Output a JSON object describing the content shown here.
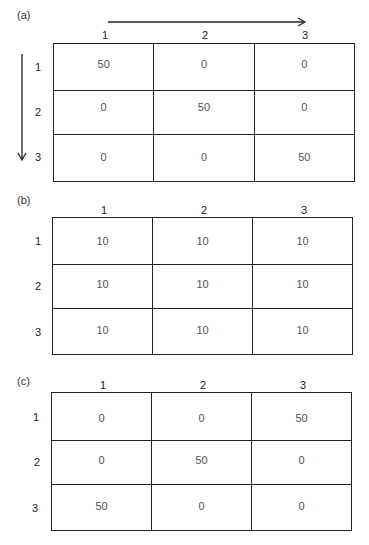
{
  "panels": [
    {
      "label": "(a)",
      "col_headers": [
        "1",
        "2",
        "3"
      ],
      "row_headers": [
        "1",
        "2",
        "3"
      ],
      "rows": [
        [
          "50",
          "0",
          "0"
        ],
        [
          "0",
          "50",
          "0"
        ],
        [
          "0",
          "0",
          "50"
        ]
      ],
      "arrows": {
        "horizontal": "right-arrow",
        "vertical": "down-arrow"
      }
    },
    {
      "label": "(b)",
      "col_headers": [
        "1",
        "2",
        "3"
      ],
      "row_headers": [
        "1",
        "2",
        "3"
      ],
      "rows": [
        [
          "10",
          "10",
          "10"
        ],
        [
          "10",
          "10",
          "10"
        ],
        [
          "10",
          "10",
          "10"
        ]
      ]
    },
    {
      "label": "(c)",
      "col_headers": [
        "1",
        "2",
        "3"
      ],
      "row_headers": [
        "1",
        "2",
        "3"
      ],
      "rows": [
        [
          "0",
          "0",
          "50"
        ],
        [
          "0",
          "50",
          "0"
        ],
        [
          "50",
          "0",
          "0"
        ]
      ]
    }
  ],
  "colors": {
    "line": "#222222",
    "cell_text": "#555555"
  }
}
